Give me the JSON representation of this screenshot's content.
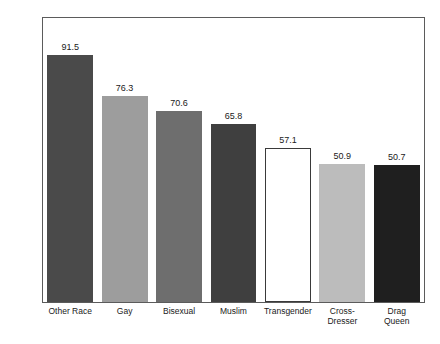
{
  "chart_data": {
    "type": "bar",
    "title": "",
    "subtitle": "",
    "xlabel": "",
    "ylabel": "",
    "ylim": [
      0,
      105
    ],
    "yticks": [
      0,
      20,
      40,
      60,
      80,
      100
    ],
    "ytick_labels": [
      "0",
      "20",
      "40",
      "60",
      "80",
      "100"
    ],
    "grid": false,
    "legend": "none",
    "value_labels_shown": true,
    "categories": [
      "Other Race",
      "Gay",
      "Bisexual",
      "Muslim",
      "Transgender",
      "Cross-Dresser",
      "Drag Queen"
    ],
    "category_label_lines": [
      [
        "Other Race"
      ],
      [
        "Gay"
      ],
      [
        "Bisexual"
      ],
      [
        "Muslim"
      ],
      [
        "Transgender"
      ],
      [
        "Cross-",
        "Dresser"
      ],
      [
        "Drag",
        "Queen"
      ]
    ],
    "values": [
      91.5,
      76.3,
      70.6,
      65.8,
      57.1,
      50.9,
      50.7
    ],
    "value_labels": [
      "91.5",
      "76.3",
      "70.6",
      "65.8",
      "57.1",
      "50.9",
      "50.7"
    ],
    "bar_colors": [
      "#4a4a4a",
      "#9d9d9d",
      "#6e6e6e",
      "#3f3f3f",
      "#ffffff",
      "#bcbcbc",
      "#1f1f1f"
    ],
    "bar_styles": [
      "filled",
      "filled",
      "filled",
      "filled",
      "hollow",
      "filled",
      "filled"
    ],
    "bar_outline_color": "#3a3a3a",
    "axis_color": "#5b5b5b",
    "text_color": "#1a1a1a",
    "background_color": "#ffffff"
  }
}
